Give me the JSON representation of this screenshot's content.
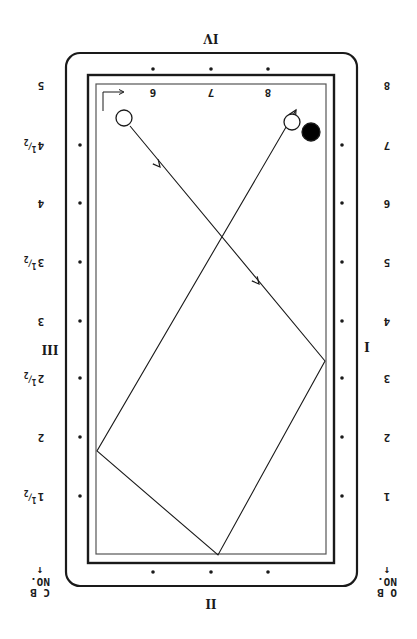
{
  "diagram": {
    "orientation": "rotated 180deg",
    "colors": {
      "ink": "#1a1a1a",
      "paper": "#ffffff",
      "rail_inner": "#555555"
    },
    "table": {
      "outer_frame": {
        "x": 66,
        "y": 53,
        "w": 291,
        "h": 533,
        "radius": 14
      },
      "cushion_border": {
        "x": 88,
        "y": 75,
        "w": 246,
        "h": 488
      },
      "play_area": {
        "x": 96,
        "y": 84,
        "w": 230,
        "h": 470
      }
    },
    "rail_labels": {
      "top": "IV",
      "bottom": "II",
      "left": "III",
      "right": "I"
    },
    "left_scale": [
      {
        "label": "5",
        "y": 85
      },
      {
        "label": "4",
        "frac": "1/2",
        "y": 145
      },
      {
        "label": "4",
        "y": 203
      },
      {
        "label": "3",
        "frac": "1/2",
        "y": 262
      },
      {
        "label": "3",
        "y": 321
      },
      {
        "label": "2",
        "frac": "1/2",
        "y": 378
      },
      {
        "label": "2",
        "y": 437
      },
      {
        "label": "1",
        "frac": "1/2",
        "y": 496
      }
    ],
    "right_scale": [
      {
        "label": "8",
        "y": 85
      },
      {
        "label": "7",
        "y": 145
      },
      {
        "label": "6",
        "y": 203
      },
      {
        "label": "5",
        "y": 262
      },
      {
        "label": "4",
        "y": 321
      },
      {
        "label": "3",
        "y": 378
      },
      {
        "label": "2",
        "y": 437
      },
      {
        "label": "1",
        "y": 496
      }
    ],
    "top_scale": [
      {
        "label": "6",
        "x": 153
      },
      {
        "label": "7",
        "x": 211
      },
      {
        "label": "8",
        "x": 268
      }
    ],
    "corner_labels": {
      "bottom_left": {
        "line1": "C B",
        "line2": "NO.",
        "arrow": "↑"
      },
      "bottom_right": {
        "line1": "O B",
        "line2": "NO.",
        "arrow": "↑"
      }
    },
    "balls": [
      {
        "name": "cue-ball",
        "x": 124,
        "y": 118,
        "r": 8,
        "fill": "#ffffff"
      },
      {
        "name": "object-ball-white",
        "x": 292,
        "y": 122,
        "r": 8,
        "fill": "#ffffff"
      },
      {
        "name": "object-ball-black",
        "x": 311,
        "y": 132,
        "r": 9,
        "fill": "#000000"
      }
    ],
    "path": {
      "points": [
        [
          130,
          126
        ],
        [
          325,
          361
        ],
        [
          218,
          555
        ],
        [
          97,
          451
        ],
        [
          296,
          110
        ]
      ],
      "arrows": [
        [
          160,
          167
        ],
        [
          259,
          284
        ],
        [
          296,
          110
        ]
      ]
    },
    "diamonds": {
      "top": [
        [
          153,
          69
        ],
        [
          211,
          69
        ],
        [
          268,
          69
        ]
      ],
      "bottom": [
        [
          153,
          572
        ],
        [
          211,
          572
        ],
        [
          268,
          572
        ]
      ],
      "left": [
        [
          80,
          145
        ],
        [
          80,
          203
        ],
        [
          80,
          262
        ],
        [
          80,
          321
        ],
        [
          80,
          378
        ],
        [
          80,
          437
        ],
        [
          80,
          496
        ]
      ],
      "right": [
        [
          342,
          145
        ],
        [
          342,
          203
        ],
        [
          342,
          262
        ],
        [
          342,
          321
        ],
        [
          342,
          378
        ],
        [
          342,
          437
        ],
        [
          342,
          496
        ]
      ]
    }
  }
}
